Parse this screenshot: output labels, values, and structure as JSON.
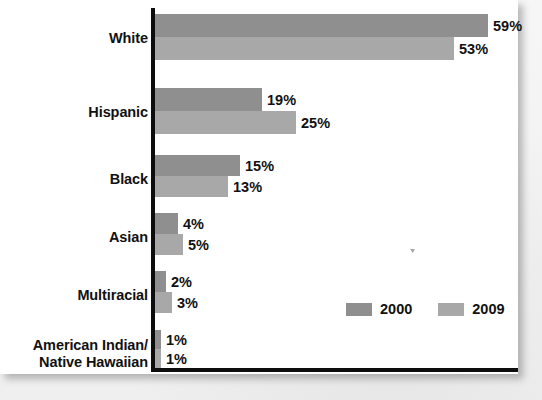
{
  "chart_data": {
    "type": "bar",
    "orientation": "horizontal",
    "title": "",
    "subtitle": "",
    "xlabel": "",
    "ylabel": "",
    "categories": [
      "White",
      "Hispanic",
      "Black",
      "Asian",
      "Multiracial",
      "American Indian/\nNative Hawaiian"
    ],
    "series": [
      {
        "name": "2000",
        "color": "#8f8f8f",
        "values": [
          59,
          19,
          15,
          4,
          2,
          1
        ]
      },
      {
        "name": "2009",
        "color": "#a8a8a8",
        "values": [
          53,
          25,
          13,
          5,
          3,
          1
        ]
      }
    ],
    "value_labels": [
      [
        "59%",
        "19%",
        "15%",
        "4%",
        "2%",
        "1%"
      ],
      [
        "53%",
        "25%",
        "13%",
        "5%",
        "3%",
        "1%"
      ]
    ],
    "value_suffix": "%",
    "xlim": [
      0,
      59
    ],
    "grid": false,
    "axis_ticks": false,
    "legend": {
      "position": "bottom-right",
      "entries": [
        {
          "label": "2000",
          "color": "#8f8f8f"
        },
        {
          "label": "2009",
          "color": "#a8a8a8"
        }
      ]
    }
  },
  "layout": {
    "px_per_percent": 5.64,
    "rows": [
      {
        "top": 14,
        "label_top": 30,
        "bar_height": 23,
        "gap": 0
      },
      {
        "top": 88,
        "label_top": 104,
        "bar_height": 23,
        "gap": 0
      },
      {
        "top": 155,
        "label_top": 171,
        "bar_height": 21,
        "gap": 0
      },
      {
        "top": 213,
        "label_top": 229,
        "bar_height": 21,
        "gap": 0
      },
      {
        "top": 271,
        "label_top": 287,
        "bar_height": 21,
        "gap": 0
      },
      {
        "top": 330,
        "label_top": 337,
        "bar_height": 19,
        "gap": 0
      }
    ]
  },
  "colors": {
    "page_background": "#f2f2f2",
    "panel_background": "#ffffff",
    "axis": "#0d0d0d",
    "text": "#111111",
    "series_2000": "#8f8f8f",
    "series_2009": "#a8a8a8"
  }
}
